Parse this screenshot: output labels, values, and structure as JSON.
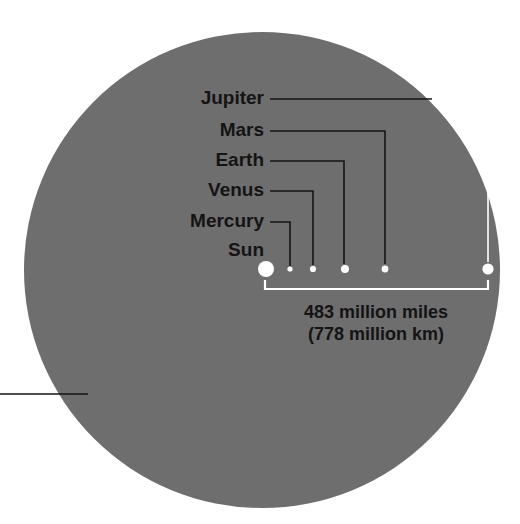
{
  "figure": {
    "background_color": "#ffffff",
    "disc_color": "#6e6e6e",
    "leader_color": "#141414",
    "bracket_color": "#ffffff",
    "body_color": "#ffffff",
    "text_color": "#141414"
  },
  "disc": {
    "name": "gray-disc",
    "cx": 262,
    "cy": 270,
    "r": 238
  },
  "bodies": [
    {
      "name": "Sun",
      "cx": 266,
      "cy": 269,
      "r": 8.0
    },
    {
      "name": "Mercury",
      "cx": 290,
      "cy": 269,
      "r": 2.6
    },
    {
      "name": "Venus",
      "cx": 313,
      "cy": 269,
      "r": 3.1
    },
    {
      "name": "Earth",
      "cx": 345,
      "cy": 269,
      "r": 4.0
    },
    {
      "name": "Mars",
      "cx": 385,
      "cy": 269,
      "r": 3.4
    },
    {
      "name": "Jupiter",
      "cx": 488,
      "cy": 269,
      "r": 5.6
    }
  ],
  "labels": [
    {
      "text": "Jupiter",
      "x": 264,
      "y": 104,
      "elbow_x": 488,
      "drop_to_y": 262,
      "line_color": "#141414",
      "outer_color": "#ffffff",
      "outer_split_x": 432
    },
    {
      "text": "Mars",
      "x": 264,
      "y": 136,
      "elbow_x": 385,
      "drop_to_y": 264,
      "line_color": "#141414"
    },
    {
      "text": "Earth",
      "x": 264,
      "y": 166,
      "elbow_x": 344,
      "drop_to_y": 264,
      "line_color": "#141414"
    },
    {
      "text": "Venus",
      "x": 264,
      "y": 196,
      "elbow_x": 313,
      "drop_to_y": 265,
      "line_color": "#141414"
    },
    {
      "text": "Mercury",
      "x": 264,
      "y": 227,
      "elbow_x": 290,
      "drop_to_y": 266,
      "line_color": "#141414"
    },
    {
      "text": "Sun",
      "x": 264,
      "y": 256,
      "elbow_x": 266,
      "drop_to_y": 261,
      "line_color": "#141414",
      "no_leader": true
    }
  ],
  "bracket": {
    "name": "distance-bracket",
    "x1": 265,
    "x2": 488,
    "y": 289,
    "tick_height": 9,
    "color": "#ffffff"
  },
  "caption": {
    "line1": "483 million miles",
    "line2": "(778 million km)",
    "x": 376,
    "y1": 318,
    "y2": 340
  },
  "left_leader": {
    "name": "left-edge-leader-line",
    "x1": 0,
    "x2": 88,
    "y": 394,
    "color": "#141414"
  }
}
